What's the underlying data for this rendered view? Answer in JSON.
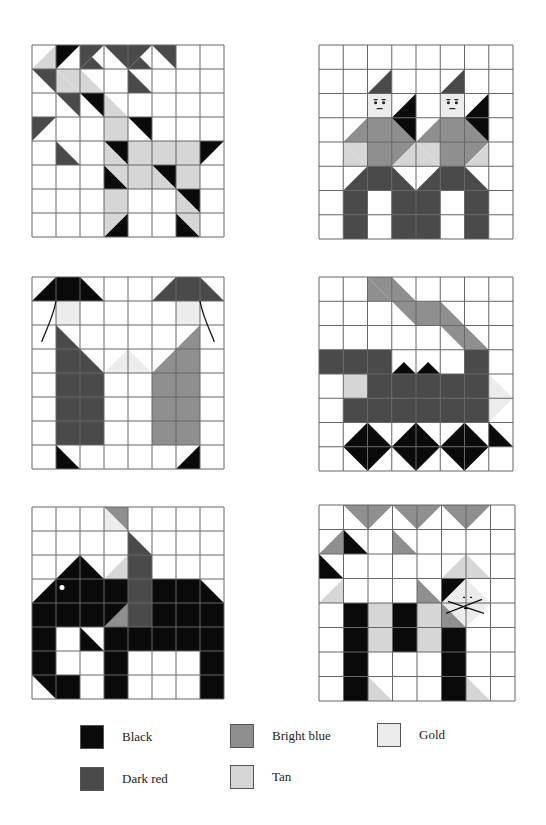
{
  "palette": {
    "k": {
      "name": "Black",
      "hex": "#0a0a0a"
    },
    "r": {
      "name": "Dark red",
      "hex": "#4a4a4a"
    },
    "b": {
      "name": "Bright blue",
      "hex": "#8f8f8f"
    },
    "t": {
      "name": "Tan",
      "hex": "#d6d6d6"
    },
    "g": {
      "name": "Gold",
      "hex": "#ececec"
    }
  },
  "grid": {
    "rows": 8,
    "cols": 8,
    "line_color": "#666666"
  },
  "panels": [
    {
      "id": "abstract-diagonal",
      "x": 31,
      "y": 44,
      "size": 192,
      "cells": [
        [
          0,
          0,
          "br",
          "t"
        ],
        [
          0,
          1,
          "tl",
          "k"
        ],
        [
          0,
          2,
          "bottom",
          "r"
        ],
        [
          0,
          2,
          "tl",
          "r"
        ],
        [
          0,
          3,
          "tr",
          "r"
        ],
        [
          0,
          4,
          "bottom",
          "r"
        ],
        [
          0,
          4,
          "tl",
          "r"
        ],
        [
          0,
          5,
          "tr",
          "r"
        ],
        [
          1,
          0,
          "tr",
          "r"
        ],
        [
          1,
          1,
          "bl",
          "t"
        ],
        [
          1,
          1,
          "tr",
          "t"
        ],
        [
          1,
          2,
          "bl",
          "t"
        ],
        [
          1,
          4,
          "bl",
          "r"
        ],
        [
          2,
          1,
          "tr",
          "r"
        ],
        [
          2,
          2,
          "tr",
          "k"
        ],
        [
          2,
          3,
          "bl",
          "t"
        ],
        [
          3,
          0,
          "tl",
          "r"
        ],
        [
          3,
          3,
          "full",
          "t"
        ],
        [
          3,
          4,
          "tr",
          "k"
        ],
        [
          4,
          1,
          "bl",
          "r"
        ],
        [
          4,
          3,
          "tr",
          "k"
        ],
        [
          4,
          3,
          "bl",
          "t"
        ],
        [
          4,
          4,
          "full",
          "t"
        ],
        [
          4,
          5,
          "full",
          "t"
        ],
        [
          4,
          6,
          "full",
          "t"
        ],
        [
          4,
          7,
          "tl",
          "k"
        ],
        [
          5,
          3,
          "bl",
          "k"
        ],
        [
          5,
          3,
          "tr",
          "t"
        ],
        [
          5,
          4,
          "full",
          "t"
        ],
        [
          5,
          5,
          "tr",
          "k"
        ],
        [
          5,
          5,
          "bl",
          "t"
        ],
        [
          5,
          6,
          "full",
          "t"
        ],
        [
          6,
          3,
          "full",
          "t"
        ],
        [
          6,
          6,
          "tr",
          "k"
        ],
        [
          6,
          6,
          "bl",
          "t"
        ],
        [
          7,
          3,
          "br",
          "k"
        ],
        [
          7,
          3,
          "tl",
          "t"
        ],
        [
          7,
          6,
          "bl",
          "k"
        ],
        [
          7,
          6,
          "tr",
          "t"
        ]
      ],
      "lines": []
    },
    {
      "id": "two-gnomes",
      "x": 318,
      "y": 44,
      "size": 194,
      "cells": [
        [
          1,
          2,
          "br",
          "r"
        ],
        [
          1,
          5,
          "br",
          "r"
        ],
        [
          2,
          2,
          "full",
          "g"
        ],
        [
          2,
          3,
          "br",
          "k"
        ],
        [
          2,
          5,
          "full",
          "g"
        ],
        [
          2,
          6,
          "br",
          "k"
        ],
        [
          3,
          1,
          "br",
          "b"
        ],
        [
          3,
          2,
          "full",
          "b"
        ],
        [
          3,
          3,
          "bl",
          "b"
        ],
        [
          3,
          3,
          "tr",
          "k"
        ],
        [
          3,
          4,
          "br",
          "b"
        ],
        [
          3,
          5,
          "full",
          "b"
        ],
        [
          3,
          6,
          "bl",
          "b"
        ],
        [
          3,
          6,
          "tr",
          "k"
        ],
        [
          4,
          1,
          "tr",
          "t"
        ],
        [
          4,
          1,
          "bl",
          "t"
        ],
        [
          4,
          2,
          "full",
          "b"
        ],
        [
          4,
          3,
          "tl",
          "b"
        ],
        [
          4,
          3,
          "br",
          "t"
        ],
        [
          4,
          4,
          "tr",
          "t"
        ],
        [
          4,
          4,
          "bl",
          "t"
        ],
        [
          4,
          5,
          "full",
          "b"
        ],
        [
          4,
          6,
          "tl",
          "b"
        ],
        [
          4,
          6,
          "br",
          "t"
        ],
        [
          5,
          1,
          "br",
          "r"
        ],
        [
          5,
          2,
          "full",
          "r"
        ],
        [
          5,
          3,
          "bl",
          "r"
        ],
        [
          5,
          4,
          "br",
          "r"
        ],
        [
          5,
          5,
          "full",
          "r"
        ],
        [
          5,
          6,
          "bl",
          "r"
        ],
        [
          6,
          1,
          "full",
          "r"
        ],
        [
          6,
          3,
          "full",
          "r"
        ],
        [
          6,
          4,
          "full",
          "r"
        ],
        [
          6,
          6,
          "full",
          "r"
        ],
        [
          7,
          1,
          "full",
          "r"
        ],
        [
          7,
          3,
          "full",
          "r"
        ],
        [
          7,
          4,
          "full",
          "r"
        ],
        [
          7,
          6,
          "full",
          "r"
        ]
      ],
      "lines": [
        {
          "type": "face",
          "cx": 2.5,
          "cy": 2.5
        },
        {
          "type": "face",
          "cx": 5.5,
          "cy": 2.5
        }
      ]
    },
    {
      "id": "two-ladies",
      "x": 31,
      "y": 276,
      "size": 192,
      "cells": [
        [
          0,
          0,
          "br",
          "k"
        ],
        [
          0,
          1,
          "full",
          "k"
        ],
        [
          0,
          2,
          "bl",
          "k"
        ],
        [
          0,
          5,
          "br",
          "r"
        ],
        [
          0,
          6,
          "full",
          "r"
        ],
        [
          0,
          7,
          "bl",
          "r"
        ],
        [
          1,
          1,
          "full",
          "g"
        ],
        [
          1,
          6,
          "full",
          "g"
        ],
        [
          2,
          1,
          "bl",
          "r"
        ],
        [
          2,
          6,
          "br",
          "b"
        ],
        [
          3,
          1,
          "full",
          "r"
        ],
        [
          3,
          2,
          "bl",
          "r"
        ],
        [
          3,
          3,
          "br",
          "g"
        ],
        [
          3,
          4,
          "bl",
          "g"
        ],
        [
          3,
          5,
          "br",
          "b"
        ],
        [
          3,
          6,
          "full",
          "b"
        ],
        [
          4,
          1,
          "full",
          "r"
        ],
        [
          4,
          2,
          "full",
          "r"
        ],
        [
          4,
          5,
          "full",
          "b"
        ],
        [
          4,
          6,
          "full",
          "b"
        ],
        [
          5,
          1,
          "full",
          "r"
        ],
        [
          5,
          2,
          "full",
          "r"
        ],
        [
          5,
          5,
          "full",
          "b"
        ],
        [
          5,
          6,
          "full",
          "b"
        ],
        [
          6,
          1,
          "full",
          "r"
        ],
        [
          6,
          2,
          "full",
          "r"
        ],
        [
          6,
          5,
          "full",
          "b"
        ],
        [
          6,
          6,
          "full",
          "b"
        ],
        [
          7,
          1,
          "bl",
          "k"
        ],
        [
          7,
          6,
          "br",
          "k"
        ]
      ],
      "lines": [
        {
          "type": "path",
          "d": "M1.0,1.0 C0.9,1.6 0.6,2.2 0.4,2.7"
        },
        {
          "type": "path",
          "d": "M7.0,1.0 C7.1,1.6 7.4,2.2 7.6,2.7"
        }
      ]
    },
    {
      "id": "tank-train",
      "x": 318,
      "y": 276,
      "size": 194,
      "cells": [
        [
          0,
          2,
          "tr",
          "b"
        ],
        [
          0,
          2,
          "bl",
          "b"
        ],
        [
          0,
          3,
          "bl",
          "b"
        ],
        [
          1,
          3,
          "tr",
          "b"
        ],
        [
          1,
          4,
          "full",
          "b"
        ],
        [
          1,
          5,
          "bl",
          "b"
        ],
        [
          2,
          5,
          "tr",
          "b"
        ],
        [
          2,
          6,
          "bl",
          "b"
        ],
        [
          3,
          0,
          "full",
          "r"
        ],
        [
          3,
          1,
          "full",
          "r"
        ],
        [
          3,
          2,
          "full",
          "r"
        ],
        [
          3,
          3,
          "bottom",
          "k"
        ],
        [
          3,
          4,
          "bottom",
          "k"
        ],
        [
          3,
          6,
          "full",
          "r"
        ],
        [
          4,
          1,
          "full",
          "t"
        ],
        [
          4,
          2,
          "full",
          "r"
        ],
        [
          4,
          3,
          "full",
          "r"
        ],
        [
          4,
          4,
          "full",
          "r"
        ],
        [
          4,
          5,
          "full",
          "r"
        ],
        [
          4,
          6,
          "full",
          "r"
        ],
        [
          4,
          7,
          "bl",
          "g"
        ],
        [
          5,
          1,
          "full",
          "r"
        ],
        [
          5,
          2,
          "full",
          "r"
        ],
        [
          5,
          3,
          "full",
          "r"
        ],
        [
          5,
          4,
          "full",
          "r"
        ],
        [
          5,
          5,
          "full",
          "r"
        ],
        [
          5,
          6,
          "full",
          "r"
        ],
        [
          5,
          7,
          "tl",
          "g"
        ],
        [
          6,
          1,
          "br",
          "k"
        ],
        [
          6,
          2,
          "bl",
          "k"
        ],
        [
          6,
          3,
          "br",
          "k"
        ],
        [
          6,
          4,
          "bl",
          "k"
        ],
        [
          6,
          5,
          "br",
          "k"
        ],
        [
          6,
          6,
          "bl",
          "k"
        ],
        [
          6,
          7,
          "bl",
          "k"
        ],
        [
          7,
          1,
          "tr",
          "k"
        ],
        [
          7,
          2,
          "tl",
          "k"
        ],
        [
          7,
          3,
          "tr",
          "k"
        ],
        [
          7,
          4,
          "tl",
          "k"
        ],
        [
          7,
          5,
          "tr",
          "k"
        ],
        [
          7,
          6,
          "tl",
          "k"
        ]
      ],
      "lines": []
    },
    {
      "id": "elephant-rider",
      "x": 31,
      "y": 506,
      "size": 192,
      "cells": [
        [
          0,
          3,
          "tr",
          "b"
        ],
        [
          0,
          3,
          "bl",
          "g"
        ],
        [
          1,
          4,
          "bl",
          "r"
        ],
        [
          2,
          1,
          "br",
          "k"
        ],
        [
          2,
          2,
          "bl",
          "k"
        ],
        [
          2,
          3,
          "br",
          "t"
        ],
        [
          2,
          4,
          "full",
          "r"
        ],
        [
          3,
          0,
          "br",
          "k"
        ],
        [
          3,
          1,
          "full",
          "k"
        ],
        [
          3,
          2,
          "full",
          "k"
        ],
        [
          3,
          3,
          "full",
          "k"
        ],
        [
          3,
          4,
          "full",
          "r"
        ],
        [
          3,
          5,
          "full",
          "k"
        ],
        [
          3,
          6,
          "full",
          "k"
        ],
        [
          3,
          7,
          "bl",
          "k"
        ],
        [
          4,
          0,
          "full",
          "k"
        ],
        [
          4,
          1,
          "full",
          "k"
        ],
        [
          4,
          2,
          "full",
          "k"
        ],
        [
          4,
          3,
          "br",
          "b"
        ],
        [
          4,
          3,
          "tl",
          "k"
        ],
        [
          4,
          4,
          "full",
          "r"
        ],
        [
          4,
          5,
          "full",
          "k"
        ],
        [
          4,
          6,
          "full",
          "k"
        ],
        [
          4,
          7,
          "full",
          "k"
        ],
        [
          5,
          0,
          "full",
          "k"
        ],
        [
          5,
          2,
          "bl",
          "k"
        ],
        [
          5,
          3,
          "full",
          "k"
        ],
        [
          5,
          4,
          "full",
          "k"
        ],
        [
          5,
          5,
          "full",
          "k"
        ],
        [
          5,
          6,
          "full",
          "k"
        ],
        [
          5,
          7,
          "full",
          "k"
        ],
        [
          6,
          0,
          "full",
          "k"
        ],
        [
          6,
          3,
          "full",
          "k"
        ],
        [
          6,
          7,
          "full",
          "k"
        ],
        [
          7,
          0,
          "tr",
          "k"
        ],
        [
          7,
          1,
          "full",
          "k"
        ],
        [
          7,
          3,
          "full",
          "k"
        ],
        [
          7,
          7,
          "full",
          "k"
        ]
      ],
      "lines": [
        {
          "type": "eye",
          "cx": 1.25,
          "cy": 3.35
        }
      ]
    },
    {
      "id": "cat-and-bars",
      "x": 318,
      "y": 504,
      "size": 196,
      "cells": [
        [
          0,
          1,
          "tr",
          "b"
        ],
        [
          0,
          2,
          "tl",
          "b"
        ],
        [
          0,
          3,
          "tr",
          "b"
        ],
        [
          0,
          4,
          "tl",
          "b"
        ],
        [
          0,
          5,
          "tr",
          "b"
        ],
        [
          0,
          6,
          "tl",
          "b"
        ],
        [
          1,
          0,
          "br",
          "b"
        ],
        [
          1,
          1,
          "bl",
          "k"
        ],
        [
          1,
          3,
          "bl",
          "b"
        ],
        [
          2,
          0,
          "bl",
          "k"
        ],
        [
          2,
          5,
          "br",
          "t"
        ],
        [
          2,
          6,
          "bl",
          "t"
        ],
        [
          3,
          0,
          "br",
          "t"
        ],
        [
          3,
          4,
          "bl",
          "b"
        ],
        [
          3,
          5,
          "tl",
          "k"
        ],
        [
          3,
          5,
          "br",
          "g"
        ],
        [
          3,
          6,
          "bl",
          "g"
        ],
        [
          4,
          1,
          "full",
          "k"
        ],
        [
          4,
          2,
          "full",
          "t"
        ],
        [
          4,
          3,
          "full",
          "k"
        ],
        [
          4,
          4,
          "full",
          "t"
        ],
        [
          4,
          5,
          "tr",
          "g"
        ],
        [
          4,
          5,
          "bl",
          "b"
        ],
        [
          4,
          6,
          "tl",
          "g"
        ],
        [
          5,
          1,
          "full",
          "k"
        ],
        [
          5,
          2,
          "full",
          "t"
        ],
        [
          5,
          3,
          "full",
          "k"
        ],
        [
          5,
          4,
          "full",
          "t"
        ],
        [
          5,
          5,
          "full",
          "k"
        ],
        [
          6,
          1,
          "full",
          "k"
        ],
        [
          6,
          5,
          "full",
          "k"
        ],
        [
          7,
          1,
          "full",
          "k"
        ],
        [
          7,
          2,
          "bl",
          "t"
        ],
        [
          7,
          5,
          "full",
          "k"
        ],
        [
          7,
          6,
          "bl",
          "t"
        ]
      ],
      "lines": [
        {
          "type": "cat-face",
          "cx": 6.0,
          "cy": 4.1
        }
      ]
    }
  ],
  "legend": [
    {
      "key": "k",
      "label": "Black",
      "x": 80,
      "y": 725
    },
    {
      "key": "b",
      "label": "Bright blue",
      "x": 230,
      "y": 724
    },
    {
      "key": "g",
      "label": "Gold",
      "x": 377,
      "y": 723
    },
    {
      "key": "r",
      "label": "Dark red",
      "x": 80,
      "y": 767
    },
    {
      "key": "t",
      "label": "Tan",
      "x": 230,
      "y": 765
    }
  ]
}
